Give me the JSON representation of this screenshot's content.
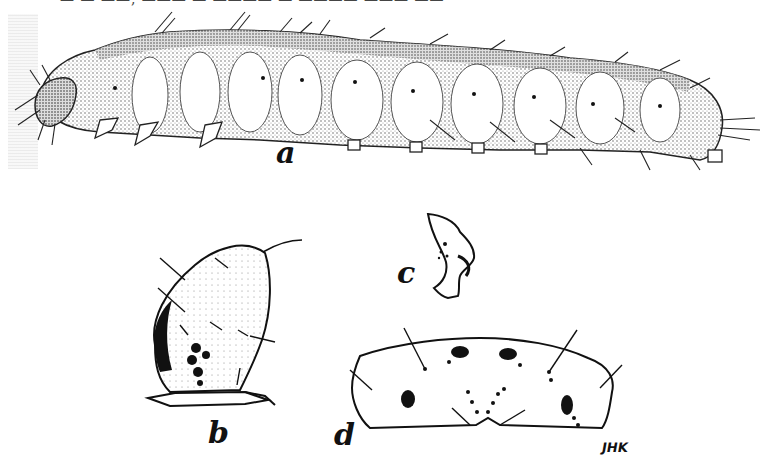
{
  "figure": {
    "type": "scientific-illustration",
    "background_color": "#ffffff",
    "ink_color": "#111111",
    "top_caption_cut": "— — ——, ——— — ———— — ———— ——— ——",
    "panels": [
      {
        "id": "a",
        "label": "a",
        "description": "lateral view of whole larva"
      },
      {
        "id": "b",
        "label": "b",
        "description": "head capsule, lateral view"
      },
      {
        "id": "c",
        "label": "c",
        "description": "mandible / mouthpart detail"
      },
      {
        "id": "d",
        "label": "d",
        "description": "dorsal plate (prothoracic shield) with setae and pigment spots"
      }
    ],
    "signature": "JHK"
  }
}
